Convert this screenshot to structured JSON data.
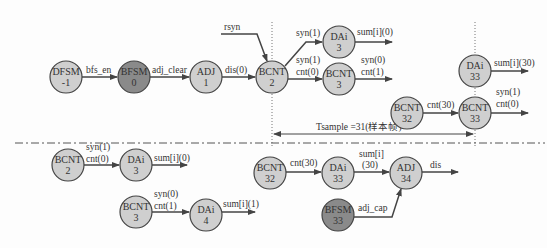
{
  "colors": {
    "node_light": "#cfcfcf",
    "node_dark": "#8a8a8a",
    "stroke": "#444444",
    "text": "#333333"
  },
  "top": {
    "nodes": [
      {
        "id": "dfsm",
        "line1": "DFSM",
        "line2": "-1",
        "x": 66,
        "y": 77,
        "shade": "light"
      },
      {
        "id": "bfsm0",
        "line1": "BFSM",
        "line2": "0",
        "x": 134,
        "y": 77,
        "shade": "dark"
      },
      {
        "id": "adj1",
        "line1": "ADJ",
        "line2": "1",
        "x": 206,
        "y": 77,
        "shade": "light"
      },
      {
        "id": "bcnt2",
        "line1": "BCNT",
        "line2": "2",
        "x": 272,
        "y": 77,
        "shade": "light"
      },
      {
        "id": "dai3",
        "line1": "DAi",
        "line2": "3",
        "x": 339,
        "y": 42,
        "shade": "light"
      },
      {
        "id": "bcnt3",
        "line1": "BCNT",
        "line2": "3",
        "x": 339,
        "y": 79,
        "shade": "light"
      },
      {
        "id": "dai33",
        "line1": "DAi",
        "line2": "33",
        "x": 475,
        "y": 71,
        "shade": "light"
      },
      {
        "id": "bcnt32",
        "line1": "BCNT",
        "line2": "32",
        "x": 407,
        "y": 113,
        "shade": "light"
      },
      {
        "id": "bcnt33",
        "line1": "BCNT",
        "line2": "33",
        "x": 475,
        "y": 113,
        "shade": "light"
      }
    ],
    "labels": {
      "bfs_en": "bfs_en",
      "adj_clear": "adj_clear",
      "dis0": "dis(0)",
      "rsyn": "rsyn",
      "syn1_a": "syn(1)",
      "sum_i_0": "sum[i](0)",
      "syn1_b": "syn(1)",
      "cnt0_a": "cnt(0)",
      "syn0": "syn(0)",
      "cnt1": "cnt(1)",
      "sum_i_30": "sum[i](30)",
      "cnt30": "cnt(30)",
      "syn1_c": "syn(1)",
      "cnt0_b": "cnt(0)",
      "tsample": "Tsample =31(样本帧)"
    }
  },
  "bottom": {
    "nodes": [
      {
        "id": "b_bcnt2",
        "line1": "BCNT",
        "line2": "2",
        "x": 68,
        "y": 165,
        "shade": "light"
      },
      {
        "id": "b_dai3",
        "line1": "DAi",
        "line2": "3",
        "x": 136,
        "y": 165,
        "shade": "light"
      },
      {
        "id": "b_bcnt3",
        "line1": "BCNT",
        "line2": "3",
        "x": 136,
        "y": 212,
        "shade": "light"
      },
      {
        "id": "b_dai4",
        "line1": "DAi",
        "line2": "4",
        "x": 206,
        "y": 215,
        "shade": "light"
      },
      {
        "id": "b_bcnt32",
        "line1": "BCNT",
        "line2": "32",
        "x": 270,
        "y": 173,
        "shade": "light"
      },
      {
        "id": "b_dai33",
        "line1": "DAi",
        "line2": "33",
        "x": 338,
        "y": 173,
        "shade": "light"
      },
      {
        "id": "b_adj34",
        "line1": "ADJ",
        "line2": "34",
        "x": 406,
        "y": 173,
        "shade": "light"
      },
      {
        "id": "b_bfsm33",
        "line1": "BFSM",
        "line2": "33",
        "x": 338,
        "y": 215,
        "shade": "dark"
      }
    ],
    "labels": {
      "syn1": "syn(1)",
      "cnt0": "cnt(0)",
      "sum_i_0": "sum[i](0)",
      "syn0": "syn(0)",
      "cnt1": "cnt(1)",
      "sum_i_1": "sum[i](1)",
      "cnt30": "cnt(30)",
      "sum_i_line1": "sum[i]",
      "sum_i_line2": "(30)",
      "dis": "dis",
      "adj_cap": "adj_cap"
    }
  }
}
